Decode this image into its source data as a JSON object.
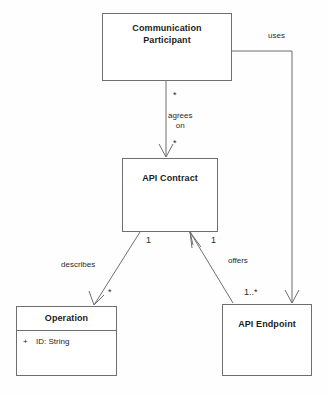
{
  "diagram": {
    "type": "uml-class-diagram",
    "background_color": "#fefefe",
    "line_color": "#6f6f6f",
    "text_color": "#1c1c1c",
    "classes": [
      {
        "id": "communication-participant",
        "name": "Communication\nParticipant",
        "name_line_1": "Communication",
        "name_line_2": "Participant",
        "attributes": []
      },
      {
        "id": "api-contract",
        "name": "API Contract",
        "attributes": []
      },
      {
        "id": "operation",
        "name": "Operation",
        "attributes": [
          {
            "visibility": "+",
            "text": "ID: String"
          }
        ]
      },
      {
        "id": "api-endpoint",
        "name": "API Endpoint",
        "attributes": []
      }
    ],
    "associations": [
      {
        "id": "agrees-on",
        "label": "agrees\non",
        "label_line_1": "agrees",
        "label_line_2": "on",
        "source": "communication-participant",
        "target": "api-contract",
        "source_multiplicity": "*",
        "target_multiplicity": "*",
        "arrow": "open"
      },
      {
        "id": "uses",
        "label": "uses",
        "source": "communication-participant",
        "target": "api-endpoint",
        "source_multiplicity": "",
        "target_multiplicity": "",
        "arrow": "open"
      },
      {
        "id": "describes",
        "label": "describes",
        "source": "api-contract",
        "target": "operation",
        "source_multiplicity": "1",
        "target_multiplicity": "*",
        "arrow": "open"
      },
      {
        "id": "offers",
        "label": "offers",
        "source": "api-endpoint",
        "target": "api-contract",
        "source_multiplicity": "1..*",
        "target_multiplicity": "1",
        "arrow": "open"
      }
    ]
  }
}
